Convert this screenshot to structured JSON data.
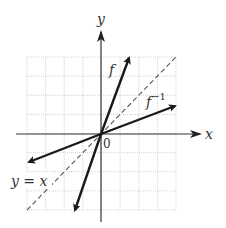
{
  "chart_data": {
    "type": "line",
    "title": "",
    "xlabel": "x",
    "ylabel": "y",
    "xlim": [
      -4,
      4
    ],
    "ylim": [
      -4,
      4
    ],
    "grid": true,
    "grid_cells": 8,
    "origin_label": "0",
    "series": [
      {
        "name": "f",
        "label": "f",
        "style": "solid-bold-arrows",
        "slope": 3,
        "x": [
          -1.4,
          1.5
        ],
        "y": [
          -4.2,
          4.1
        ]
      },
      {
        "name": "f^-1",
        "label": "f",
        "label_sup": "−1",
        "style": "solid-bold-arrows",
        "slope": 0.3333,
        "x": [
          -3.9,
          4.0
        ],
        "y": [
          -1.5,
          1.5
        ]
      },
      {
        "name": "y = x",
        "label": "y = x",
        "style": "dashed",
        "slope": 1,
        "x": [
          -4,
          4
        ],
        "y": [
          -4,
          4
        ]
      }
    ]
  },
  "labels": {
    "x_axis": "x",
    "y_axis": "y",
    "origin": "0",
    "f": "f",
    "f_inv_base": "f",
    "f_inv_sup": "−1",
    "identity": "y = x"
  },
  "colors": {
    "grid": "#c8c8c8",
    "axis": "#333333",
    "curve": "#1a1a1a",
    "dashed": "#555555"
  }
}
